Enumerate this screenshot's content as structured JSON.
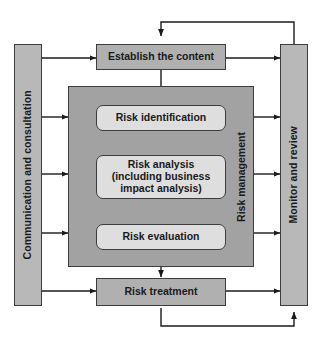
{
  "diagram": {
    "colors": {
      "background": "#ffffff",
      "side_bar_fill": "#b8b8b8",
      "process_box_fill": "#b0b0b0",
      "panel_fill": "#a2a2a2",
      "step_box_fill": "#dedede",
      "stroke": "#3d3d3d",
      "text": "#1a1a1a"
    },
    "side_labels": {
      "left": "Communication and consultation",
      "right": "Monitor and review"
    },
    "panel_label": "Risk management",
    "nodes": [
      {
        "id": "establish",
        "label": "Establish the content",
        "shape": "rect"
      },
      {
        "id": "identification",
        "label": "Risk identification",
        "shape": "rounded-rect"
      },
      {
        "id": "analysis",
        "shape": "rounded-rect",
        "lines": [
          "Risk analysis",
          "(including business",
          "impact analysis)"
        ]
      },
      {
        "id": "evaluation",
        "label": "Risk evaluation",
        "shape": "rounded-rect"
      },
      {
        "id": "treatment",
        "label": "Risk treatment",
        "shape": "rect"
      }
    ],
    "connectors": [
      {
        "from": "establish",
        "to": "identification",
        "type": "arrow-down"
      },
      {
        "from": "identification",
        "to": "analysis",
        "type": "arrow-down"
      },
      {
        "from": "analysis",
        "to": "evaluation",
        "type": "arrow-down"
      },
      {
        "from": "evaluation",
        "to": "treatment",
        "type": "arrow-down"
      },
      {
        "from": "left-bar",
        "to": "establish",
        "type": "double-arrow"
      },
      {
        "from": "left-bar",
        "to": "risk-management-panel",
        "type": "double-arrow"
      },
      {
        "from": "left-bar",
        "to": "treatment",
        "type": "double-arrow"
      },
      {
        "from": "right-bar",
        "to": "establish",
        "type": "double-arrow"
      },
      {
        "from": "right-bar",
        "to": "risk-management-panel",
        "type": "double-arrow"
      },
      {
        "from": "right-bar",
        "to": "treatment",
        "type": "double-arrow"
      },
      {
        "from": "right-bar",
        "to": "establish",
        "type": "feedback-loop-top"
      },
      {
        "from": "treatment",
        "to": "right-bar",
        "type": "feedback-loop-bottom"
      }
    ]
  }
}
